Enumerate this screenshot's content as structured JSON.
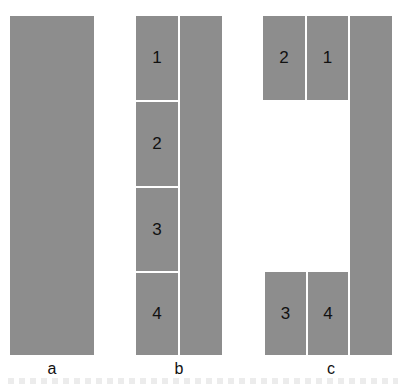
{
  "panels": {
    "a": {
      "label": "a"
    },
    "b": {
      "label": "b",
      "cells": [
        "1",
        "2",
        "3",
        "4"
      ]
    },
    "c": {
      "label": "c",
      "top": [
        "2",
        "1"
      ],
      "bottom": [
        "3",
        "4"
      ]
    }
  },
  "colors": {
    "block": "#8d8d8d",
    "gap": "#ffffff"
  }
}
